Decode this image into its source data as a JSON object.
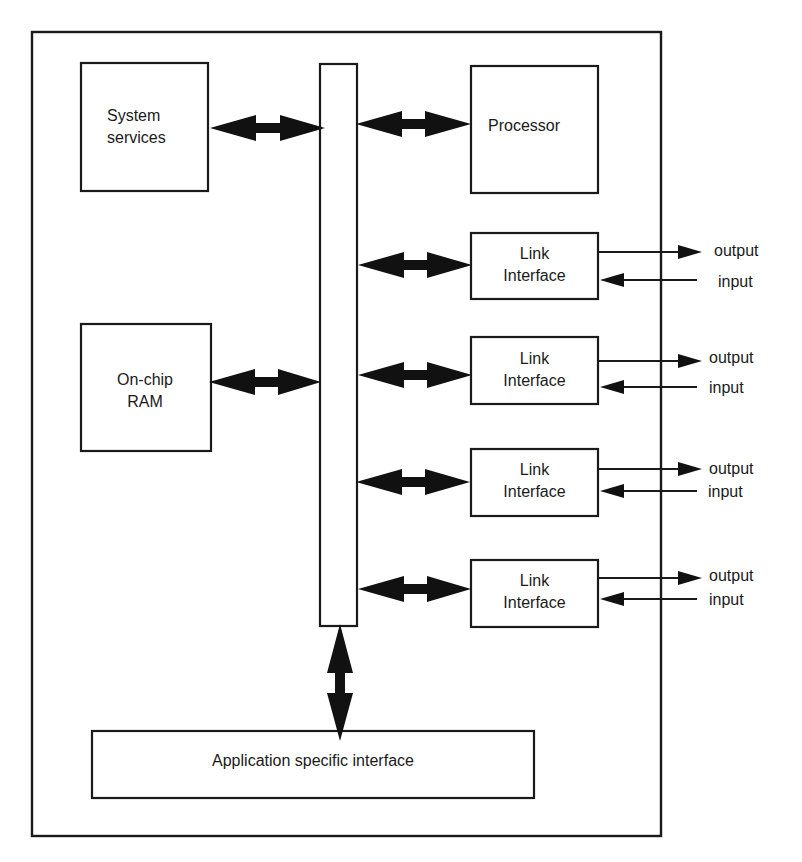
{
  "diagram": {
    "type": "block-diagram",
    "colors": {
      "stroke": "#1a1a1a",
      "arrow_fill": "#111111",
      "background": "#ffffff"
    },
    "blocks": {
      "system_services": {
        "line1": "System",
        "line2": "services"
      },
      "processor": {
        "label": "Processor"
      },
      "on_chip_ram": {
        "line1": "On-chip",
        "line2": "RAM"
      },
      "bus": {
        "label": ""
      },
      "application_interface": {
        "label": "Application specific interface"
      },
      "link_interfaces": [
        {
          "line1": "Link",
          "line2": "Interface",
          "output": "output",
          "input": "input"
        },
        {
          "line1": "Link",
          "line2": "Interface",
          "output": "output",
          "input": "input"
        },
        {
          "line1": "Link",
          "line2": "Interface",
          "output": "output",
          "input": "input"
        },
        {
          "line1": "Link",
          "line2": "Interface",
          "output": "output",
          "input": "input"
        }
      ]
    },
    "connections": [
      {
        "from": "system_services",
        "to": "bus",
        "kind": "bidirectional"
      },
      {
        "from": "processor",
        "to": "bus",
        "kind": "bidirectional"
      },
      {
        "from": "on_chip_ram",
        "to": "bus",
        "kind": "bidirectional"
      },
      {
        "from": "link_interface_1",
        "to": "bus",
        "kind": "bidirectional"
      },
      {
        "from": "link_interface_2",
        "to": "bus",
        "kind": "bidirectional"
      },
      {
        "from": "link_interface_3",
        "to": "bus",
        "kind": "bidirectional"
      },
      {
        "from": "link_interface_4",
        "to": "bus",
        "kind": "bidirectional"
      },
      {
        "from": "bus",
        "to": "application_interface",
        "kind": "bidirectional"
      }
    ]
  }
}
